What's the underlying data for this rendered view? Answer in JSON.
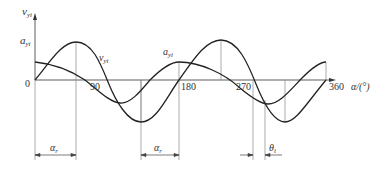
{
  "diagram": {
    "title": "",
    "y_axis_label": "v",
    "y_axis_sub": "yi",
    "y_tick_label": "a",
    "y_tick_sub": "yi",
    "x_axis_label": "α/(°)",
    "origin_label": "0",
    "x_ticks": [
      "90",
      "180",
      "270",
      "360"
    ],
    "curves": [
      {
        "name": "v",
        "sub": "yi",
        "label_text": "v"
      },
      {
        "name": "a",
        "sub": "yi",
        "label_text": "a"
      }
    ],
    "dimensions": [
      {
        "label": "α",
        "sub": "r",
        "desc": "first interval"
      },
      {
        "label": "α",
        "sub": "r",
        "desc": "second interval"
      },
      {
        "label": "θ",
        "sub": "i",
        "desc": "phase offset"
      }
    ],
    "colors": {
      "line": "#222222",
      "guide": "#777777",
      "text": "#333333"
    }
  }
}
